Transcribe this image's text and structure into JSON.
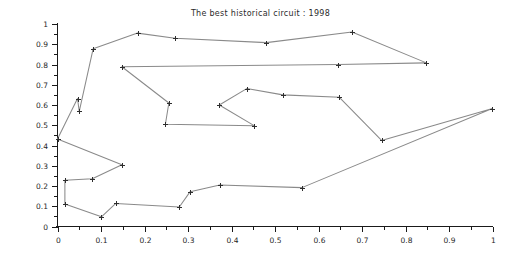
{
  "chart_data": {
    "type": "line",
    "title": "The best historical circuit : 1998",
    "xlabel": "",
    "ylabel": "",
    "xlim": [
      0,
      1
    ],
    "ylim": [
      0,
      1
    ],
    "grid": false,
    "legend": null,
    "marker": "plus",
    "line_color": "#8a8a8a",
    "marker_color": "#2e2e2e",
    "closed_tour": true,
    "x_ticks": [
      0,
      0.1,
      0.2,
      0.3,
      0.4,
      0.5,
      0.6,
      0.7,
      0.8,
      0.9,
      1
    ],
    "x_tick_labels": [
      "0",
      "0.1",
      "0.2",
      "0.3",
      "0.4",
      "0.5",
      "0.6",
      "0.7",
      "0.8",
      "0.9",
      "1"
    ],
    "x_minor_ticks": [
      0.05,
      0.15,
      0.25,
      0.35,
      0.45,
      0.55,
      0.65,
      0.75,
      0.85,
      0.95
    ],
    "y_ticks": [
      0,
      0.1,
      0.2,
      0.3,
      0.4,
      0.5,
      0.6,
      0.7,
      0.8,
      0.9,
      1
    ],
    "y_tick_labels": [
      "0",
      "0.1",
      "0.2",
      "0.3",
      "0.4",
      "0.5",
      "0.6",
      "0.7",
      "0.8",
      "0.9",
      "1"
    ],
    "y_minor_ticks": [
      0.05,
      0.15,
      0.25,
      0.35,
      0.45,
      0.55,
      0.65,
      0.75,
      0.85,
      0.95
    ],
    "points": [
      [
        0.0,
        0.432
      ],
      [
        0.046,
        0.632
      ],
      [
        0.05,
        0.568
      ],
      [
        0.082,
        0.878
      ],
      [
        0.184,
        0.955
      ],
      [
        0.27,
        0.93
      ],
      [
        0.48,
        0.908
      ],
      [
        0.677,
        0.96
      ],
      [
        0.848,
        0.808
      ],
      [
        0.645,
        0.8
      ],
      [
        0.148,
        0.789
      ],
      [
        0.256,
        0.61
      ],
      [
        0.248,
        0.505
      ],
      [
        0.452,
        0.498
      ],
      [
        0.372,
        0.6
      ],
      [
        0.435,
        0.681
      ],
      [
        0.518,
        0.65
      ],
      [
        0.648,
        0.638
      ],
      [
        0.745,
        0.425
      ],
      [
        0.998,
        0.582
      ],
      [
        0.562,
        0.192
      ],
      [
        0.373,
        0.205
      ],
      [
        0.305,
        0.172
      ],
      [
        0.28,
        0.096
      ],
      [
        0.134,
        0.114
      ],
      [
        0.101,
        0.048
      ],
      [
        0.017,
        0.111
      ],
      [
        0.017,
        0.228
      ],
      [
        0.08,
        0.236
      ],
      [
        0.148,
        0.305
      ]
    ]
  }
}
